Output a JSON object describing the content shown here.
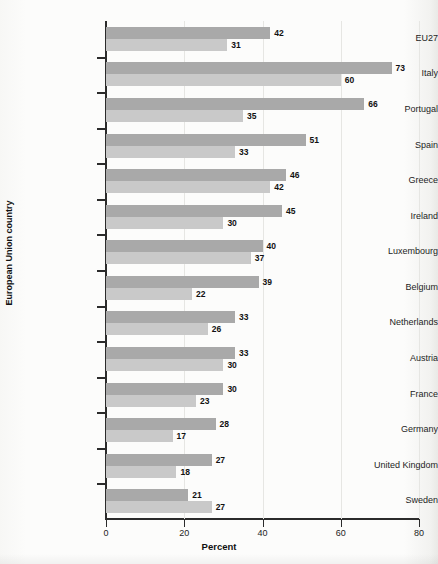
{
  "chart_data": {
    "type": "bar",
    "orientation": "horizontal",
    "title": "",
    "xlabel": "Percent",
    "ylabel": "European Union country",
    "xlim": [
      0,
      80
    ],
    "xticks": [
      0,
      20,
      40,
      60,
      80
    ],
    "grid": "vertical",
    "legend_position": "bottom-right-inside",
    "categories": [
      "EU27",
      "Italy",
      "Portugal",
      "Spain",
      "Greece",
      "Ireland",
      "Luxembourg",
      "Belgium",
      "Netherlands",
      "Austria",
      "France",
      "Germany",
      "United Kingdom",
      "Sweden"
    ],
    "series": [
      {
        "name": "Women",
        "color": "#a9a9a9",
        "values": [
          42,
          73,
          66,
          51,
          46,
          45,
          40,
          39,
          33,
          33,
          30,
          28,
          27,
          21
        ]
      },
      {
        "name": "Men",
        "color": "#c9c9c9",
        "values": [
          31,
          60,
          35,
          33,
          42,
          30,
          37,
          22,
          26,
          30,
          23,
          17,
          18,
          27
        ]
      }
    ]
  },
  "legend": {
    "items": [
      {
        "label": "Men",
        "swatch": "men"
      },
      {
        "label": "Women",
        "swatch": "women"
      }
    ]
  }
}
